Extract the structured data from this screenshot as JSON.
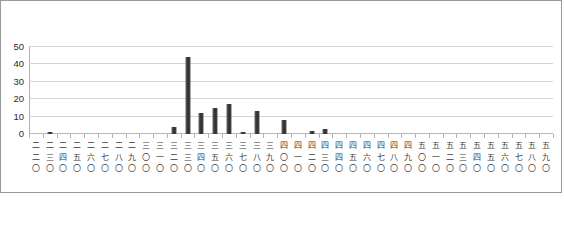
{
  "chart_data": {
    "type": "bar",
    "title": "",
    "subtitle": "",
    "xlabel": "",
    "ylabel": "",
    "ylim": [
      0,
      50
    ],
    "yticks": [
      0,
      10,
      20,
      30,
      40,
      50
    ],
    "grid": true,
    "legend": false,
    "legend_position": "none",
    "bar_color": "#3a3a3a",
    "gridline_color": "#d4d4d4",
    "axis_color": "#b0b0b0",
    "border_color": "#9a9a9a",
    "categories": [
      "二二〇",
      "二三〇",
      "二四〇",
      "二五〇",
      "二六〇",
      "二七〇",
      "二八〇",
      "二九〇",
      "三〇〇",
      "三一〇",
      "三二〇",
      "三三〇",
      "三四〇",
      "三五〇",
      "三六〇",
      "三七〇",
      "三八〇",
      "三九〇",
      "四〇〇",
      "四一〇",
      "四二〇",
      "四三〇",
      "四四〇",
      "四五〇",
      "四六〇",
      "四七〇",
      "四八〇",
      "四九〇",
      "五〇〇",
      "五一〇",
      "五二〇",
      "五三〇",
      "五四〇",
      "五五〇",
      "五六〇",
      "五七〇",
      "五八〇",
      "五九〇"
    ],
    "values": [
      0,
      1,
      0,
      0,
      0,
      0,
      0,
      0,
      0,
      0,
      4,
      44,
      12,
      15,
      17,
      1,
      13,
      0,
      8,
      0,
      2,
      3,
      0,
      0,
      0,
      0,
      0,
      0,
      0,
      0,
      0,
      0,
      0,
      0,
      0,
      0,
      0,
      0
    ]
  }
}
